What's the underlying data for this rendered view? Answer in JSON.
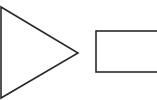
{
  "diagram": {
    "background": "#ffffff",
    "stroke_color": "#2a2a2a",
    "shapes": [
      {
        "id": "triangle",
        "type": "triangle",
        "direction": "right",
        "points": "1,7 1,98 78,53",
        "stroke_width": 1.6,
        "fill": "#ffffff"
      },
      {
        "id": "rectangle",
        "type": "rectangle",
        "x": 96,
        "y": 31,
        "width": 70,
        "height": 41,
        "stroke_width": 1.6,
        "fill": "#ffffff"
      }
    ]
  }
}
